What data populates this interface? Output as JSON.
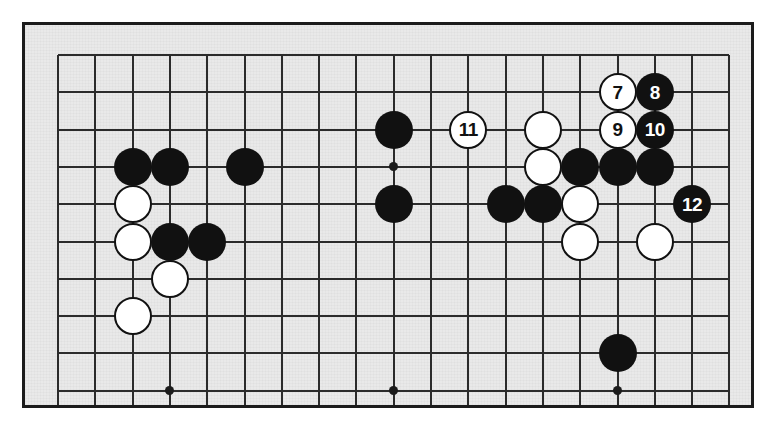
{
  "diagram": {
    "type": "go-board-problem-diagram",
    "board_background_color": "#e9e9e9",
    "grid_line_color": "#2b2b2b",
    "frame_color": "#1b1b1b",
    "black_stone_color": "#111111",
    "white_stone_color": "#ffffff",
    "number_color_on_black": "#ffffff",
    "number_color_on_white": "#111111"
  },
  "board": {
    "columns": 19,
    "visible_columns": 19,
    "visible_rows": 10,
    "cropped": true,
    "crop_note": "bottom of board cut off by image edge",
    "grid_origin_x": 33,
    "grid_origin_y": 30,
    "grid_spacing": 37.3,
    "star_points": [
      {
        "col": 3,
        "row": 9
      },
      {
        "col": 9,
        "row": 9
      },
      {
        "col": 15,
        "row": 9
      },
      {
        "col": 9,
        "row": 3
      }
    ]
  },
  "stones": [
    {
      "col": 2,
      "row": 3,
      "color": "black",
      "number": ""
    },
    {
      "col": 3,
      "row": 3,
      "color": "black",
      "number": ""
    },
    {
      "col": 5,
      "row": 3,
      "color": "black",
      "number": ""
    },
    {
      "col": 2,
      "row": 4,
      "color": "white",
      "number": ""
    },
    {
      "col": 2,
      "row": 5,
      "color": "white",
      "number": ""
    },
    {
      "col": 3,
      "row": 5,
      "color": "black",
      "number": ""
    },
    {
      "col": 4,
      "row": 5,
      "color": "black",
      "number": ""
    },
    {
      "col": 3,
      "row": 6,
      "color": "white",
      "number": ""
    },
    {
      "col": 2,
      "row": 7,
      "color": "white",
      "number": ""
    },
    {
      "col": 9,
      "row": 2,
      "color": "black",
      "number": ""
    },
    {
      "col": 9,
      "row": 4,
      "color": "black",
      "number": ""
    },
    {
      "col": 11,
      "row": 2,
      "color": "white",
      "number": "11"
    },
    {
      "col": 13,
      "row": 2,
      "color": "white",
      "number": ""
    },
    {
      "col": 13,
      "row": 3,
      "color": "white",
      "number": ""
    },
    {
      "col": 12,
      "row": 4,
      "color": "black",
      "number": ""
    },
    {
      "col": 13,
      "row": 4,
      "color": "black",
      "number": ""
    },
    {
      "col": 14,
      "row": 3,
      "color": "black",
      "number": ""
    },
    {
      "col": 15,
      "row": 3,
      "color": "black",
      "number": ""
    },
    {
      "col": 16,
      "row": 3,
      "color": "black",
      "number": ""
    },
    {
      "col": 14,
      "row": 4,
      "color": "white",
      "number": ""
    },
    {
      "col": 14,
      "row": 5,
      "color": "white",
      "number": ""
    },
    {
      "col": 16,
      "row": 5,
      "color": "white",
      "number": ""
    },
    {
      "col": 15,
      "row": 1,
      "color": "white",
      "number": "7"
    },
    {
      "col": 16,
      "row": 1,
      "color": "black",
      "number": "8"
    },
    {
      "col": 15,
      "row": 2,
      "color": "white",
      "number": "9"
    },
    {
      "col": 16,
      "row": 2,
      "color": "black",
      "number": "10"
    },
    {
      "col": 17,
      "row": 4,
      "color": "black",
      "number": "12"
    },
    {
      "col": 15,
      "row": 8,
      "color": "black",
      "number": ""
    }
  ],
  "move_numbers": {
    "visible": [
      "7",
      "8",
      "9",
      "10",
      "11",
      "12"
    ],
    "first_visible": 7,
    "last_visible": 12
  }
}
